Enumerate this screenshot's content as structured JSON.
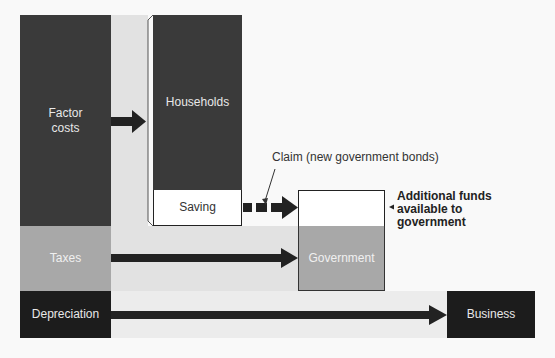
{
  "diagram": {
    "nodes": {
      "factor_costs": "Factor\ncosts",
      "households": "Households",
      "saving": "Saving",
      "taxes": "Taxes",
      "government": "Government",
      "depreciation": "Depreciation",
      "business": "Business",
      "additional_funds": "Additional funds\navailable to\ngovernment"
    },
    "annotations": {
      "claim": "Claim (new government bonds)"
    },
    "edges": [
      {
        "from": "Factor costs",
        "to": "Households",
        "style": "solid"
      },
      {
        "from": "Saving",
        "to": "Additional funds available to government",
        "style": "dashed"
      },
      {
        "from": "Taxes",
        "to": "Government",
        "style": "solid"
      },
      {
        "from": "Depreciation",
        "to": "Business",
        "style": "solid"
      }
    ],
    "colors": {
      "dark": "#3a3a3a",
      "black": "#1c1c1c",
      "mid_gray": "#a8a8a8",
      "light_gray": "#e2e2e2",
      "white": "#ffffff"
    }
  }
}
